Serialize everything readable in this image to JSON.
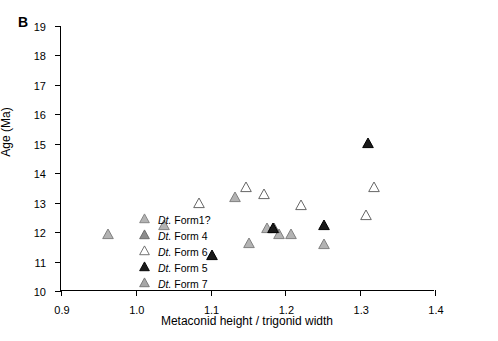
{
  "panel_label": "B",
  "chart_data": {
    "type": "scatter",
    "title": "",
    "xlabel": "Metaconid height / trigonid width",
    "ylabel": "Age (Ma)",
    "xlim": [
      0.9,
      1.4
    ],
    "ylim": [
      19,
      10
    ],
    "y_inverted": true,
    "xticks": [
      "0.9",
      "1.0",
      "1.1",
      "1.2",
      "1.3",
      "1.4"
    ],
    "xtick_values": [
      0.9,
      1.0,
      1.1,
      1.2,
      1.3,
      1.4
    ],
    "yticks": [
      "10",
      "11",
      "12",
      "13",
      "14",
      "15",
      "16",
      "17",
      "18",
      "19"
    ],
    "ytick_values": [
      10,
      11,
      12,
      13,
      14,
      15,
      16,
      17,
      18,
      19
    ],
    "grid": false,
    "legend_position": "lower-left-inside",
    "series": [
      {
        "name": "Dt. Form1?",
        "marker": "triangle-up",
        "fill": "#b3b3b3",
        "stroke": "#808080",
        "points": [
          {
            "x": 0.963,
            "y": 12.0
          },
          {
            "x": 1.038,
            "y": 12.3
          },
          {
            "x": 1.132,
            "y": 13.25
          },
          {
            "x": 1.152,
            "y": 11.7
          },
          {
            "x": 1.176,
            "y": 12.2
          },
          {
            "x": 1.192,
            "y": 12.0
          },
          {
            "x": 1.208,
            "y": 12.0
          },
          {
            "x": 1.252,
            "y": 11.65
          }
        ]
      },
      {
        "name": "Dt. Form 4",
        "marker": "triangle-up",
        "fill": "#8c8c8c",
        "stroke": "#666666",
        "points": [
          {
            "x": 1.185,
            "y": 12.2
          }
        ]
      },
      {
        "name": "Dt. Form 6",
        "marker": "triangle-up-open",
        "fill": "#ffffff",
        "stroke": "#666666",
        "points": [
          {
            "x": 1.084,
            "y": 13.05
          },
          {
            "x": 1.147,
            "y": 13.6
          },
          {
            "x": 1.172,
            "y": 13.35
          },
          {
            "x": 1.221,
            "y": 13.0
          },
          {
            "x": 1.308,
            "y": 12.65
          },
          {
            "x": 1.318,
            "y": 13.6
          }
        ]
      },
      {
        "name": "Dt. Form 5",
        "marker": "triangle-up-filled",
        "fill": "#1a1a1a",
        "stroke": "#000000",
        "points": [
          {
            "x": 1.102,
            "y": 11.3
          },
          {
            "x": 1.184,
            "y": 12.2
          },
          {
            "x": 1.252,
            "y": 12.3
          },
          {
            "x": 1.311,
            "y": 15.1
          }
        ]
      },
      {
        "name": "Dt. Form 7",
        "marker": "triangle-up",
        "fill": "#a6a6a6",
        "stroke": "#737373",
        "points": []
      }
    ],
    "legend_entries": [
      {
        "prefix": "Dt.",
        "text": " Form1?",
        "marker": "triangle-up",
        "fill": "#b3b3b3",
        "stroke": "#808080"
      },
      {
        "prefix": "Dt.",
        "text": " Form 4",
        "marker": "triangle-up",
        "fill": "#8c8c8c",
        "stroke": "#666666"
      },
      {
        "prefix": "Dt.",
        "text": " Form 6",
        "marker": "triangle-up-open",
        "fill": "#ffffff",
        "stroke": "#666666"
      },
      {
        "prefix": "Dt.",
        "text": " Form 5",
        "marker": "triangle-up-filled",
        "fill": "#1a1a1a",
        "stroke": "#000000"
      },
      {
        "prefix": "Dt.",
        "text": " Form 7",
        "marker": "triangle-up",
        "fill": "#a6a6a6",
        "stroke": "#737373"
      }
    ]
  }
}
